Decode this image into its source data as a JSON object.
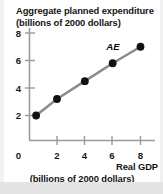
{
  "figure": {
    "background_color": "#ffffff",
    "axis_color": "#9a9a9a",
    "line_color": "#8c8c8c",
    "marker_color": "#111111",
    "text_color": "#151515"
  },
  "chart_data": {
    "type": "line",
    "title": "",
    "ylabel_line1": "Aggregate planned expenditure",
    "ylabel_line2": "(billions of 2000 dollars)",
    "xlabel_line1": "Real GDP",
    "xlabel_line2": "(billions of 2000 dollars)",
    "x": [
      0.5,
      2,
      4,
      6,
      8
    ],
    "values": [
      2.0,
      3.2,
      4.5,
      5.8,
      7.0
    ],
    "series": [
      {
        "name": "AE",
        "x": [
          0.5,
          2,
          4,
          6,
          8
        ],
        "values": [
          2.0,
          3.2,
          4.5,
          5.8,
          7.0
        ]
      }
    ],
    "series_label": "AE",
    "xlim": [
      0,
      9
    ],
    "ylim": [
      0,
      8.8
    ],
    "xticks": [
      2,
      4,
      6,
      8
    ],
    "yticks": [
      2,
      4,
      6,
      8
    ],
    "xtick_labels": [
      "2",
      "4",
      "6",
      "8"
    ],
    "ytick_labels": [
      "2",
      "4",
      "6",
      "8"
    ],
    "origin_label": "0",
    "grid": false,
    "legend": "none",
    "markers": "filled-circle"
  }
}
